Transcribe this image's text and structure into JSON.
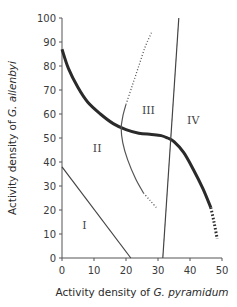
{
  "chart_data": {
    "type": "line",
    "title": "",
    "xlabel_prefix": "Activity density of ",
    "xlabel_species": "G. pyramidum",
    "ylabel_prefix": "Activity density of ",
    "ylabel_species": "G. allenbyi",
    "xlim": [
      0,
      50
    ],
    "ylim": [
      0,
      100
    ],
    "xticks": [
      0,
      10,
      20,
      30,
      40,
      50
    ],
    "yticks": [
      0,
      10,
      20,
      30,
      40,
      50,
      60,
      70,
      80,
      90,
      100
    ],
    "grid": false,
    "legend": "none",
    "regions": [
      {
        "label": "I",
        "x": 7,
        "y": 12
      },
      {
        "label": "II",
        "x": 11,
        "y": 44
      },
      {
        "label": "III",
        "x": 27,
        "y": 60
      },
      {
        "label": "IV",
        "x": 41,
        "y": 56
      }
    ],
    "series": [
      {
        "name": "isocline-thick",
        "style": "thick-solid",
        "x": [
          0,
          2,
          5,
          8,
          12,
          16,
          20,
          24,
          28,
          31,
          33,
          35,
          38,
          41,
          44,
          46.5
        ],
        "y": [
          87,
          79,
          71,
          65,
          60,
          56,
          53.5,
          52,
          51.5,
          51,
          50,
          48.5,
          44,
          37,
          29,
          21
        ]
      },
      {
        "name": "isocline-thick-dotted",
        "style": "thick-dotted",
        "x": [
          46.5,
          47.5,
          48.5
        ],
        "y": [
          21,
          15,
          8
        ]
      },
      {
        "name": "boundary-I-II",
        "style": "solid",
        "x": [
          0,
          21.5
        ],
        "y": [
          38,
          0
        ]
      },
      {
        "name": "boundary-III-IV",
        "style": "solid",
        "x": [
          31.5,
          36.5
        ],
        "y": [
          0,
          100
        ]
      },
      {
        "name": "thin-curve-solid",
        "style": "thin-solid",
        "x": [
          20,
          19,
          18.5,
          19,
          20.5,
          23,
          25.5
        ],
        "y": [
          64,
          59,
          54,
          48,
          41,
          33,
          27
        ]
      },
      {
        "name": "thin-curve-dotted-upper",
        "style": "dotted",
        "x": [
          20,
          22,
          24,
          26,
          28
        ],
        "y": [
          64,
          72,
          80,
          88,
          94
        ]
      },
      {
        "name": "thin-curve-dotted-lower",
        "style": "dotted",
        "x": [
          25.5,
          27.5,
          29.5
        ],
        "y": [
          27,
          24,
          21
        ]
      }
    ]
  }
}
